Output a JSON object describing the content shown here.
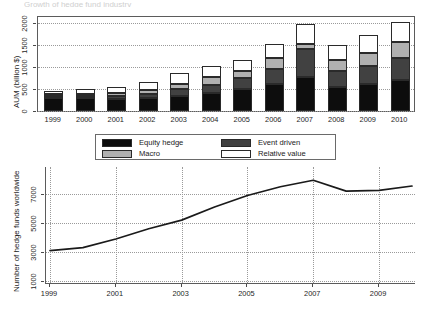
{
  "figure": {
    "cropped_header_text": "Growth of hedge fund industry"
  },
  "chart_data": [
    {
      "type": "bar",
      "id": "aum-stacked-bar",
      "title": "",
      "xlabel": "",
      "ylabel": "AUM (billion $)",
      "stacked": true,
      "ylim": [
        0,
        2200
      ],
      "yticks": [
        0,
        500,
        1000,
        1500,
        2000
      ],
      "ytick_labels": [
        "0",
        "500",
        "1000",
        "1500",
        "2000"
      ],
      "grid": true,
      "legend_position": "below-plot",
      "categories": [
        "1999",
        "2000",
        "2001",
        "2002",
        "2003",
        "2004",
        "2005",
        "2006",
        "2007",
        "2008",
        "2009",
        "2010"
      ],
      "series": [
        {
          "name": "Equity hedge",
          "color": "#0d0d0d",
          "values": [
            290,
            285,
            275,
            300,
            350,
            420,
            490,
            620,
            780,
            550,
            610,
            710
          ]
        },
        {
          "name": "Event driven",
          "color": "#414141",
          "values": [
            60,
            65,
            75,
            90,
            145,
            180,
            250,
            330,
            620,
            350,
            420,
            490
          ]
        },
        {
          "name": "Macro",
          "color": "#b0b0b0",
          "values": [
            40,
            45,
            55,
            85,
            110,
            170,
            180,
            250,
            120,
            260,
            290,
            360
          ]
        },
        {
          "name": "Relative value",
          "color": "#ffffff",
          "values": [
            60,
            110,
            140,
            190,
            250,
            260,
            250,
            330,
            450,
            340,
            400,
            470
          ]
        }
      ],
      "totals": [
        450,
        505,
        545,
        665,
        855,
        1030,
        1170,
        1530,
        1970,
        1500,
        1720,
        2030
      ]
    },
    {
      "type": "line",
      "id": "hedge-fund-count-line",
      "title": "",
      "xlabel": "",
      "ylabel": "Number of hedge funds worldwide",
      "ylim": [
        1000,
        8300
      ],
      "yticks": [
        1000,
        3000,
        5000,
        7000
      ],
      "ytick_labels": [
        "1000",
        "3000",
        "5000",
        "7000"
      ],
      "xlim": [
        1999,
        2010
      ],
      "xticks": [
        1999,
        2001,
        2003,
        2005,
        2007,
        2009
      ],
      "xtick_labels": [
        "1999",
        "2001",
        "2003",
        "2005",
        "2007",
        "2009"
      ],
      "grid": true,
      "line_color": "#1a1a1a",
      "x": [
        1999,
        2000,
        2001,
        2002,
        2003,
        2004,
        2005,
        2006,
        2007,
        2008,
        2009,
        2010
      ],
      "values": [
        3100,
        3300,
        3900,
        4600,
        5200,
        6100,
        6900,
        7500,
        7950,
        7200,
        7250,
        7550
      ]
    }
  ],
  "bar_chart": {
    "y_axis_title": "AUM (billion $)",
    "y_tick_labels": [
      "0",
      "500",
      "1000",
      "1500",
      "2000"
    ],
    "x_tick_labels": [
      "1999",
      "2000",
      "2001",
      "2002",
      "2003",
      "2004",
      "2005",
      "2006",
      "2007",
      "2008",
      "2009",
      "2010"
    ]
  },
  "legend": {
    "items": [
      {
        "label": "Equity hedge",
        "color": "#0d0d0d"
      },
      {
        "label": "Event driven",
        "color": "#414141"
      },
      {
        "label": "Macro",
        "color": "#b0b0b0"
      },
      {
        "label": "Relative value",
        "color": "#ffffff"
      }
    ]
  },
  "line_chart": {
    "y_axis_title": "Number of hedge funds worldwide",
    "y_tick_labels": [
      "1000",
      "3000",
      "5000",
      "7000"
    ],
    "x_tick_labels": [
      "1999",
      "2001",
      "2003",
      "2005",
      "2007",
      "2009"
    ]
  }
}
